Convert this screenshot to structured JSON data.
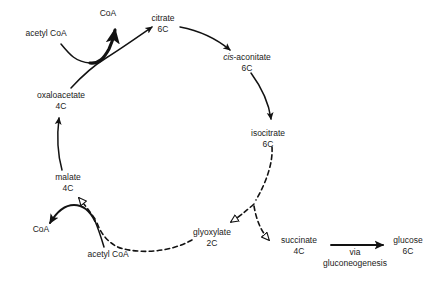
{
  "diagram": {
    "stroke_color": "#121212",
    "background_color": "#ffffff",
    "nodes": [
      {
        "id": "acetyl-coa-top",
        "name": "acetyl CoA",
        "carbons": "",
        "x": 46,
        "y": 33
      },
      {
        "id": "coa-top",
        "name": "CoA",
        "carbons": "",
        "x": 108,
        "y": 13
      },
      {
        "id": "citrate",
        "name": "citrate",
        "carbons": "6C",
        "x": 163,
        "y": 18
      },
      {
        "id": "cis-aconitate",
        "name": "cis-aconitate",
        "carbons": "6C",
        "x": 247,
        "y": 57
      },
      {
        "id": "isocitrate",
        "name": "isocitrate",
        "carbons": "6C",
        "x": 268,
        "y": 133
      },
      {
        "id": "oxaloacetate",
        "name": "oxaloacetate",
        "carbons": "4C",
        "x": 61,
        "y": 95
      },
      {
        "id": "malate",
        "name": "malate",
        "carbons": "4C",
        "x": 68,
        "y": 177
      },
      {
        "id": "coa-bottom",
        "name": "CoA",
        "carbons": "",
        "x": 41,
        "y": 229
      },
      {
        "id": "acetyl-coa-bottom",
        "name": "acetyl CoA",
        "carbons": "",
        "x": 108,
        "y": 254
      },
      {
        "id": "glyoxylate",
        "name": "glyoxylate",
        "carbons": "2C",
        "x": 212,
        "y": 232
      },
      {
        "id": "succinate",
        "name": "succinate",
        "carbons": "4C",
        "x": 299,
        "y": 240
      },
      {
        "id": "glucose",
        "name": "glucose",
        "carbons": "6C",
        "x": 408,
        "y": 240
      }
    ],
    "edge_label": {
      "id": "gluconeogenesis-label",
      "line1": "via",
      "line2": "gluconeogenesis",
      "x": 355,
      "y": 252
    },
    "italic_prefix": "cis",
    "italic_node_id": "cis-aconitate"
  }
}
